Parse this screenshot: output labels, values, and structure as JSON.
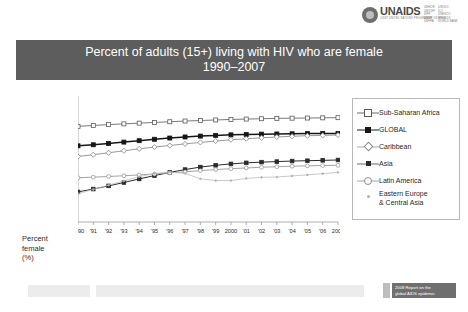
{
  "header": {
    "logo_word": "UNAIDS",
    "logo_tagline": "JOINT UNITED NATIONS PROGRAMME ON HIV/AIDS",
    "cosponsors_col1": [
      "UNHCR",
      "UNICEF",
      "WFP",
      "UNDP",
      "UNFPA"
    ],
    "cosponsors_col2": [
      "UNODC",
      "ILO",
      "UNESCO",
      "WHO",
      "WORLD BANK"
    ]
  },
  "title": {
    "line1": "Percent of adults (15+) living with HIV who are female",
    "line2": "1990–2007"
  },
  "axis_label": {
    "line1": "Percent",
    "line2": "female",
    "line3": "(%)"
  },
  "legend": {
    "items": [
      {
        "label": "Sub-Saharan Africa",
        "marker": "open-square",
        "line": "normal"
      },
      {
        "label": "GLOBAL",
        "marker": "filled-square",
        "line": "bold"
      },
      {
        "label": "Caribbean",
        "marker": "open-diamond",
        "line": "normal"
      },
      {
        "label": "Asia",
        "marker": "filled-square-small",
        "line": "normal"
      },
      {
        "label": "Latin America",
        "marker": "open-circle",
        "line": "normal"
      },
      {
        "label": "Eastern Europe",
        "label2": "& Central Asia",
        "marker": "small-dot",
        "line": "none"
      }
    ]
  },
  "footer": {
    "source_line1": "2008 Report on the",
    "source_line2": "global AIDS epidemic"
  },
  "colors": {
    "banner": "#5d5d5d",
    "global_line": "#161616",
    "subsaharan_line": "#6b6b6b",
    "caribbean_line": "#8d8d8d",
    "asia_line": "#2b2b2b",
    "latin_line": "#9a9a9a",
    "easteurope_line": "#b0b0b0",
    "legend_border": "#b9b9b9",
    "footer_bar": "#ececec"
  },
  "chart_data": {
    "type": "line",
    "title": "Percent of adults (15+) living with HIV who are female 1990–2007",
    "xlabel": "",
    "ylabel": "Percent female (%)",
    "ylim": [
      0,
      70
    ],
    "ytick_step": 10,
    "yticks": [
      0,
      10,
      20,
      30,
      40,
      50,
      60,
      70
    ],
    "grid": false,
    "legend_position": "right",
    "x": [
      1990,
      1991,
      1992,
      1993,
      1994,
      1995,
      1996,
      1997,
      1998,
      1999,
      2000,
      2001,
      2002,
      2003,
      2004,
      2005,
      2006,
      2007
    ],
    "xtick_labels": [
      "1990",
      "'91",
      "'92",
      "'93",
      "'94",
      "'95",
      "'96",
      "'97",
      "'98",
      "'99",
      "2000",
      "'01",
      "'02",
      "'03",
      "'04",
      "'05",
      "'06",
      "2007"
    ],
    "series": [
      {
        "name": "Sub-Saharan Africa",
        "values": [
          54,
          54.5,
          55,
          55.4,
          55.8,
          56.2,
          56.6,
          57,
          57.3,
          57.6,
          57.9,
          58.1,
          58.3,
          58.5,
          58.6,
          58.7,
          58.8,
          58.9
        ]
      },
      {
        "name": "GLOBAL",
        "values": [
          43,
          43.6,
          44.3,
          45.1,
          45.9,
          46.7,
          47.4,
          48.0,
          48.5,
          48.9,
          49.2,
          49.4,
          49.6,
          49.7,
          49.8,
          49.9,
          50.0,
          50.0
        ]
      },
      {
        "name": "Caribbean",
        "values": [
          37,
          38,
          39.1,
          40.2,
          41.3,
          42.3,
          43.2,
          44.1,
          44.9,
          45.7,
          46.4,
          47.0,
          47.5,
          48.0,
          48.4,
          48.7,
          48.9,
          49.1
        ]
      },
      {
        "name": "Asia",
        "values": [
          17,
          18.6,
          20.4,
          22.3,
          24.3,
          26.2,
          28.0,
          29.6,
          31.0,
          32.0,
          32.8,
          33.4,
          33.8,
          34.1,
          34.4,
          34.6,
          34.8,
          35.0
        ]
      },
      {
        "name": "Latin America",
        "values": [
          25,
          25.3,
          25.7,
          26.1,
          26.6,
          27.1,
          27.7,
          28.3,
          29.0,
          29.6,
          30.1,
          30.5,
          30.9,
          31.2,
          31.5,
          31.7,
          31.9,
          32.0
        ]
      },
      {
        "name": "Eastern Europe & Central Asia",
        "values": [
          16,
          18.4,
          20.8,
          23.2,
          25.6,
          27.4,
          28.2,
          27.4,
          24.4,
          23.4,
          23.4,
          24.6,
          25.2,
          25.4,
          26.0,
          26.6,
          27.3,
          28.0
        ]
      }
    ]
  }
}
